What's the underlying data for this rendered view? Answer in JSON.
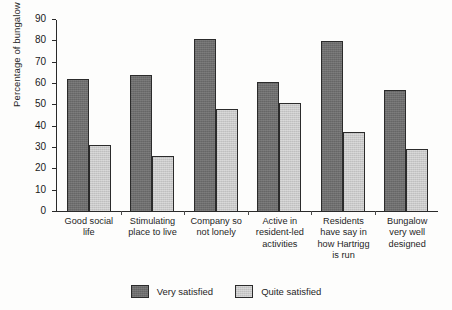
{
  "chart_data": {
    "type": "bar",
    "title": "",
    "xlabel": "",
    "ylabel": "Percentage of bungalow residents",
    "ylim": [
      0,
      90
    ],
    "ytick_step": 10,
    "yticks": [
      0,
      10,
      20,
      30,
      40,
      50,
      60,
      70,
      80,
      90
    ],
    "grid": false,
    "legend_position": "bottom-center",
    "categories": [
      "Good social life",
      "Stimulating place to live",
      "Company so not lonely",
      "Active in resident-led activities",
      "Residents have say in how Hartrigg is run",
      "Bungalow very well designed"
    ],
    "category_lines": [
      [
        "Good social",
        "life"
      ],
      [
        "Stimulating",
        "place to live"
      ],
      [
        "Company so",
        "not lonely"
      ],
      [
        "Active in",
        "resident-led",
        "activities"
      ],
      [
        "Residents",
        "have say in",
        "how Hartrigg",
        "is run"
      ],
      [
        "Bungalow",
        "very well",
        "designed"
      ]
    ],
    "series": [
      {
        "name": "Very satisfied",
        "color": "#6e6e6e",
        "values": [
          62,
          64,
          81,
          61,
          80,
          57
        ]
      },
      {
        "name": "Quite satisfied",
        "color": "#c9c9c9",
        "values": [
          31,
          26,
          48,
          51,
          37,
          29
        ]
      }
    ]
  },
  "legend": {
    "items": [
      {
        "label": "Very satisfied",
        "swatch": "dark"
      },
      {
        "label": "Quite satisfied",
        "swatch": "light"
      }
    ]
  }
}
